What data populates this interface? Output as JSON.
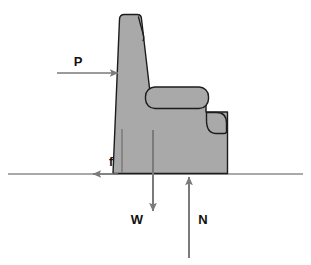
{
  "diagram": {
    "type": "free-body-diagram",
    "background_color": "#ffffff",
    "object": {
      "name": "chair",
      "fill_color": "#a9a9a9",
      "stroke_color": "#1c1c1c",
      "stroke_width": 1.4,
      "parts": [
        {
          "name": "chair-back",
          "description": "tall slanted seat back with rounded top"
        },
        {
          "name": "chair-back-inner-seam",
          "description": "curved crease line near top right of back"
        },
        {
          "name": "armrest",
          "description": "horizontal rounded-rectangle armrest"
        },
        {
          "name": "armrest-front-scroll",
          "description": "rolled front scroll of armrest"
        },
        {
          "name": "chair-seat-base",
          "description": "rectangular seat base resting on ground"
        },
        {
          "name": "seat-front-seam",
          "description": "vertical seam line on the base front"
        }
      ]
    },
    "ground_line": {
      "name": "ground-line",
      "color": "#8c8c8c",
      "y": 174,
      "x_start": 8,
      "x_end": 303
    },
    "forces": [
      {
        "id": "P",
        "label": "P",
        "description": "applied horizontal push force on the chair back",
        "direction": "right",
        "color": "#7a7a7a",
        "label_color": "#111111",
        "label_x": 78,
        "label_y": 66,
        "tail_x": 57,
        "tail_y": 73,
        "head_x": 118,
        "head_y": 73
      },
      {
        "id": "f",
        "label": "f",
        "description": "friction force acting leftward along the ground",
        "direction": "left",
        "color": "#7a7a7a",
        "label_color": "#111111",
        "label_x": 111,
        "label_y": 164,
        "tail_x": 118,
        "tail_y": 174,
        "head_x": 93,
        "head_y": 174
      },
      {
        "id": "W",
        "label": "W",
        "description": "weight of the chair acting downward at the center of gravity",
        "direction": "down",
        "color": "#7a7a7a",
        "label_color": "#111111",
        "label_x": 133,
        "label_y": 223,
        "tail_x": 153,
        "tail_y": 130,
        "head_x": 153,
        "head_y": 211
      },
      {
        "id": "N",
        "label": "N",
        "description": "normal reaction force of the ground acting upward",
        "direction": "up",
        "color": "#7a7a7a",
        "label_color": "#111111",
        "label_x": 200,
        "label_y": 223,
        "tail_x": 189,
        "tail_y": 258,
        "head_x": 189,
        "head_y": 177
      }
    ]
  }
}
